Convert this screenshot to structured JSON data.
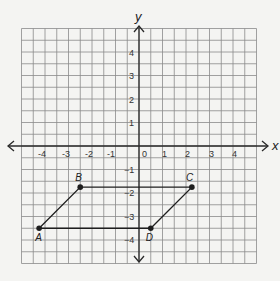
{
  "figure": {
    "axes": {
      "x_label": "x",
      "y_label": "y",
      "x_ticks": [
        "-4",
        "-3",
        "-2",
        "-1",
        "0",
        "1",
        "2",
        "3",
        "4"
      ],
      "y_ticks_positive": [
        "4",
        "3",
        "2",
        "1"
      ],
      "y_ticks_negative": [
        "1",
        "2",
        "3",
        "4"
      ],
      "range": {
        "x": [
          -5,
          5
        ],
        "y": [
          -5,
          5
        ]
      },
      "grid_step": 0.5
    },
    "shape": {
      "type": "parallelogram",
      "vertices": [
        {
          "label": "A",
          "x": -4.25,
          "y": -3.5
        },
        {
          "label": "B",
          "x": -2.5,
          "y": -1.75
        },
        {
          "label": "C",
          "x": 2.25,
          "y": -1.75
        },
        {
          "label": "D",
          "x": 0.5,
          "y": -3.5
        }
      ]
    },
    "colors": {
      "background": "#f4f4f2",
      "grid": "#8a8a8a",
      "axis": "#2a2a2a",
      "shape": "#1e1e1e"
    }
  }
}
